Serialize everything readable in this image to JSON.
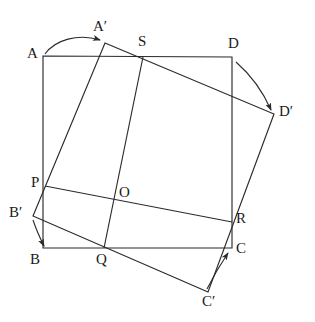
{
  "figure": {
    "stroke_color": "#2b2b2b",
    "label_color": "#1a1a1a",
    "background": "#ffffff",
    "width": 315,
    "height": 322
  },
  "labels": {
    "A": {
      "text": "A",
      "x": 27,
      "y": 46
    },
    "Ap": {
      "text": "A′",
      "x": 93,
      "y": 19
    },
    "S": {
      "text": "S",
      "x": 138,
      "y": 34
    },
    "D": {
      "text": "D",
      "x": 228,
      "y": 36
    },
    "Dp": {
      "text": "D′",
      "x": 279,
      "y": 104
    },
    "P": {
      "text": "P",
      "x": 31,
      "y": 175
    },
    "O": {
      "text": "O",
      "x": 119,
      "y": 185
    },
    "R": {
      "text": "R",
      "x": 236,
      "y": 211
    },
    "Bp": {
      "text": "B′",
      "x": 9,
      "y": 205
    },
    "B": {
      "text": "B",
      "x": 30,
      "y": 252
    },
    "Q": {
      "text": "Q",
      "x": 96,
      "y": 252
    },
    "C": {
      "text": "C",
      "x": 236,
      "y": 241
    },
    "Cp": {
      "text": "C′",
      "x": 202,
      "y": 294
    }
  },
  "points": {
    "A": {
      "x": 43,
      "y": 56
    },
    "B": {
      "x": 43,
      "y": 248
    },
    "C": {
      "x": 232,
      "y": 248
    },
    "D": {
      "x": 232,
      "y": 57
    },
    "Ap": {
      "x": 105,
      "y": 43
    },
    "Bp": {
      "x": 33,
      "y": 216
    },
    "Cp": {
      "x": 208,
      "y": 292
    },
    "Dp": {
      "x": 274,
      "y": 114
    },
    "P": {
      "x": 45,
      "y": 186
    },
    "Q": {
      "x": 104,
      "y": 248
    },
    "R": {
      "x": 232,
      "y": 222
    },
    "S": {
      "x": 143,
      "y": 57
    },
    "O": {
      "x": 124,
      "y": 198
    }
  },
  "shapes": {
    "square_abcd": "Square A B C D",
    "square_aprime": "Rotated square A' B' C' D'",
    "chord_pr": "Segment P R",
    "chord_qs": "Segment Q S"
  },
  "arrows": {
    "a_to_ap": {
      "label": "rotation arrow A to A'",
      "from": "A",
      "to": "A'"
    },
    "d_to_dp": {
      "label": "rotation arrow D to D'",
      "from": "D",
      "to": "D'"
    },
    "b_to_bp": {
      "label": "rotation arrow B' to B",
      "from": "B'",
      "to": "B"
    },
    "c_to_cp": {
      "label": "rotation arrow C' to C",
      "from": "C'",
      "to": "C"
    }
  }
}
